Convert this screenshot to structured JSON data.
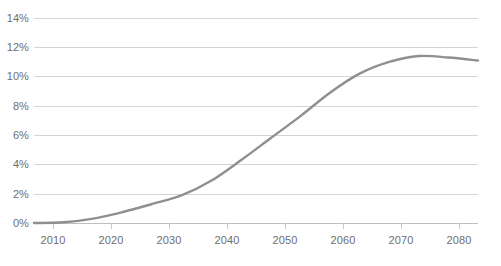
{
  "chart_data": {
    "type": "line",
    "title": "",
    "subtitle": "",
    "xlabel": "",
    "ylabel": "",
    "xlim": [
      2005,
      2080
    ],
    "ylim": [
      0,
      14
    ],
    "grid": true,
    "legend": false,
    "legend_position": "none",
    "line_color": "#8f8f8f",
    "grid_color": "#d4d4d4",
    "axis_color": "#bfbfbf",
    "tick_label_color": "#6e6e6e",
    "y_ticks": [
      "0%",
      "2%",
      "4%",
      "6%",
      "8%",
      "10%",
      "12%",
      "14%"
    ],
    "y_tick_values": [
      0,
      2,
      4,
      6,
      8,
      10,
      12,
      14
    ],
    "x_ticks": [
      "2010",
      "2020",
      "2030",
      "2040",
      "2050",
      "2060",
      "2070",
      "2080"
    ],
    "x_tick_values": [
      2010,
      2020,
      2030,
      2040,
      2050,
      2060,
      2070,
      2080
    ],
    "series": [
      {
        "name": "share",
        "x": [
          2005,
          2010,
          2015,
          2020,
          2025,
          2030,
          2035,
          2040,
          2045,
          2050,
          2055,
          2060,
          2065,
          2070,
          2075,
          2080
        ],
        "values": [
          0.0,
          0.05,
          0.3,
          0.75,
          1.3,
          1.9,
          2.9,
          4.3,
          5.8,
          7.3,
          8.9,
          10.2,
          11.0,
          11.4,
          11.3,
          11.1
        ]
      }
    ]
  }
}
